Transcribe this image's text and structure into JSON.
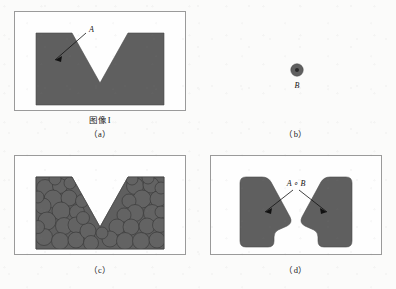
{
  "figure": {
    "background_color": "#fbfbfa",
    "fill_color": "#5f5f5f",
    "outline_color": "#3a3a3a",
    "frame_color": "#9a9a9a",
    "panels": [
      {
        "id": "a",
        "caption": "（a）",
        "inner_label": "图像I",
        "annotation": "A",
        "description": "V-notched rectangular set A",
        "has_arrow": true
      },
      {
        "id": "b",
        "caption": "（b）",
        "inner_label": "",
        "annotation": "B",
        "description": "Disk-shaped structuring element B with origin dot",
        "has_arrow": false
      },
      {
        "id": "c",
        "caption": "（c）",
        "inner_label": "",
        "annotation": "",
        "description": "Translates of B rolling inside A",
        "has_arrow": false
      },
      {
        "id": "d",
        "caption": "（d）",
        "inner_label": "",
        "annotation": "A ∘ B",
        "description": "Result of the opening: two rounded lobes",
        "has_arrow": true
      }
    ]
  },
  "colors": {
    "fill": "#5f5f5f",
    "fill_light": "#6a6a6a",
    "stroke": "#3c3c3c",
    "frame": "#9a9a9a",
    "page": "#fbfbfa",
    "text": "#111111"
  }
}
